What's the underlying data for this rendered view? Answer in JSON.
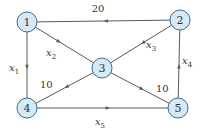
{
  "diagram": {
    "type": "directed-network",
    "nodes": [
      {
        "id": "1",
        "label": "1"
      },
      {
        "id": "2",
        "label": "2"
      },
      {
        "id": "3",
        "label": "3"
      },
      {
        "id": "4",
        "label": "4"
      },
      {
        "id": "5",
        "label": "5"
      }
    ],
    "edges": [
      {
        "from": "2",
        "to": "1",
        "label": "20",
        "kind": "value"
      },
      {
        "from": "1",
        "to": "3",
        "label": "x2",
        "kind": "var",
        "var": "x",
        "sub": "2"
      },
      {
        "from": "2",
        "to": "3",
        "label": "x3",
        "kind": "var",
        "var": "x",
        "sub": "3"
      },
      {
        "from": "1",
        "to": "4",
        "label": "x1",
        "kind": "var",
        "var": "x",
        "sub": "1"
      },
      {
        "from": "3",
        "to": "4",
        "label": "10",
        "kind": "value"
      },
      {
        "from": "3",
        "to": "5",
        "label": "10",
        "kind": "value"
      },
      {
        "from": "5",
        "to": "2",
        "label": "x4",
        "kind": "var",
        "var": "x",
        "sub": "4"
      },
      {
        "from": "4",
        "to": "5",
        "label": "x5",
        "kind": "var",
        "var": "x",
        "sub": "5"
      }
    ],
    "colors": {
      "node_fill": "#d6e9f5",
      "node_stroke": "#3c6e8c",
      "edge": "#5a5a5a",
      "text": "#333333"
    }
  }
}
